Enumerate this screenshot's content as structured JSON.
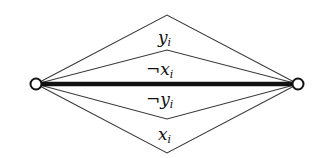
{
  "diagram": {
    "nodes": [
      {
        "id": "left",
        "cx": 36,
        "cy": 84,
        "r": 5
      },
      {
        "id": "right",
        "cx": 298,
        "cy": 84,
        "r": 5
      }
    ],
    "central_edge": {
      "from": "left",
      "to": "right",
      "style": "thick"
    },
    "paths": [
      {
        "id": "top-outer",
        "apex_x": 167,
        "apex_y": 15
      },
      {
        "id": "top-inner",
        "apex_x": 167,
        "apex_y": 50
      },
      {
        "id": "bottom-inner",
        "apex_x": 167,
        "apex_y": 119
      },
      {
        "id": "bottom-outer",
        "apex_x": 167,
        "apex_y": 153
      }
    ],
    "labels": [
      {
        "id": "y_i",
        "neg": "",
        "base": "y",
        "sub": "i",
        "x": 160,
        "y": 42
      },
      {
        "id": "not_x_i",
        "neg": "¬",
        "base": "x",
        "sub": "i",
        "x": 152,
        "y": 74
      },
      {
        "id": "not_y_i",
        "neg": "¬",
        "base": "y",
        "sub": "i",
        "x": 152,
        "y": 104
      },
      {
        "id": "x_i",
        "neg": "",
        "base": "x",
        "sub": "i",
        "x": 160,
        "y": 139
      }
    ],
    "colors": {
      "stroke": "#333333",
      "thick": "#111111",
      "node_fill": "#ffffff"
    }
  }
}
